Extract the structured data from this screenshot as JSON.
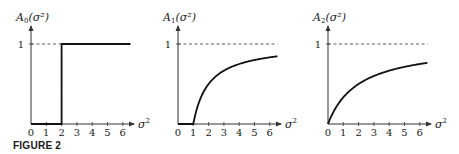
{
  "caption": "FIGURE 2",
  "chart_data": [
    {
      "type": "line",
      "title": "",
      "ylabel": "A0(σ²)",
      "xlabel": "σ²",
      "xlim": [
        0,
        6.5
      ],
      "ylim": [
        0,
        1
      ],
      "xticks": [
        "0",
        "1",
        "2",
        "3",
        "4",
        "5",
        "6"
      ],
      "yticks": [
        "1"
      ],
      "reference_line": {
        "y": 1,
        "style": "dashed"
      },
      "vertical_guide": {
        "x": 2,
        "style": "dotted"
      },
      "series": [
        {
          "name": "A0",
          "x": [
            0,
            2,
            2,
            6.5
          ],
          "y": [
            0,
            0,
            1,
            1
          ]
        }
      ],
      "grid": false
    },
    {
      "type": "line",
      "title": "",
      "ylabel": "A1(σ²)",
      "xlabel": "σ²",
      "xlim": [
        0,
        6.5
      ],
      "ylim": [
        0,
        1
      ],
      "xticks": [
        "0",
        "1",
        "2",
        "3",
        "4",
        "5",
        "6"
      ],
      "yticks": [
        "1"
      ],
      "reference_line": {
        "y": 1,
        "style": "dashed"
      },
      "series": [
        {
          "name": "A1",
          "x": [
            0,
            1,
            1.5,
            2,
            3,
            4,
            5,
            6,
            6.5
          ],
          "y": [
            0,
            0,
            0.33,
            0.5,
            0.67,
            0.75,
            0.8,
            0.83,
            0.85
          ]
        }
      ],
      "grid": false
    },
    {
      "type": "line",
      "title": "",
      "ylabel": "A2(σ²)",
      "xlabel": "σ²",
      "xlim": [
        0,
        6.5
      ],
      "ylim": [
        0,
        1
      ],
      "xticks": [
        "0",
        "1",
        "2",
        "3",
        "4",
        "5",
        "6"
      ],
      "yticks": [
        "1"
      ],
      "reference_line": {
        "y": 1,
        "style": "dashed"
      },
      "series": [
        {
          "name": "A2",
          "x": [
            0,
            0.5,
            1,
            2,
            3,
            4,
            5,
            6,
            6.5
          ],
          "y": [
            0,
            0.2,
            0.33,
            0.5,
            0.6,
            0.67,
            0.71,
            0.75,
            0.76
          ]
        }
      ],
      "grid": false
    }
  ],
  "panels": [
    {
      "ylabel_main": "A",
      "ylabel_sub": "0",
      "ylabel_arg": "(σ²)",
      "one": "1",
      "xlabel": "σ",
      "xlabel_sup": "2"
    },
    {
      "ylabel_main": "A",
      "ylabel_sub": "1",
      "ylabel_arg": "(σ²)",
      "one": "1",
      "xlabel": "σ",
      "xlabel_sup": "2"
    },
    {
      "ylabel_main": "A",
      "ylabel_sub": "2",
      "ylabel_arg": "(σ²)",
      "one": "1",
      "xlabel": "σ",
      "xlabel_sup": "2"
    }
  ]
}
